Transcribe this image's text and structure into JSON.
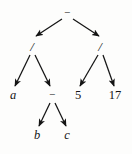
{
  "figure": {
    "kind": "expression-tree",
    "background_color": "#fdfdfc",
    "stroke_color": "#141414",
    "width": 132,
    "height": 154
  },
  "nodes": [
    {
      "id": "root",
      "label": "−",
      "role": "operator",
      "kind": "minus",
      "x": 67,
      "y": 12
    },
    {
      "id": "divL",
      "label": "/",
      "role": "operator",
      "kind": "slash",
      "x": 32,
      "y": 46
    },
    {
      "id": "divR",
      "label": "/",
      "role": "operator",
      "kind": "slash",
      "x": 100,
      "y": 46
    },
    {
      "id": "a",
      "label": "a",
      "role": "variable",
      "kind": "var",
      "x": 13,
      "y": 95
    },
    {
      "id": "minus2",
      "label": "−",
      "role": "operator",
      "kind": "minus",
      "x": 52,
      "y": 94
    },
    {
      "id": "five",
      "label": "5",
      "role": "number",
      "kind": "num",
      "x": 78,
      "y": 95
    },
    {
      "id": "seven",
      "label": "17",
      "role": "number",
      "kind": "num",
      "x": 115,
      "y": 95
    },
    {
      "id": "b",
      "label": "b",
      "role": "variable",
      "kind": "var",
      "x": 37,
      "y": 135
    },
    {
      "id": "c",
      "label": "c",
      "role": "variable",
      "kind": "var",
      "x": 67,
      "y": 135
    }
  ],
  "edges": [
    {
      "from": "root",
      "to": "divL",
      "x1": 62,
      "y1": 19,
      "x2": 36,
      "y2": 36
    },
    {
      "from": "root",
      "to": "divR",
      "x1": 73,
      "y1": 19,
      "x2": 99,
      "y2": 36
    },
    {
      "from": "divL",
      "to": "a",
      "x1": 30,
      "y1": 55,
      "x2": 15,
      "y2": 86
    },
    {
      "from": "divL",
      "to": "minus2",
      "x1": 35,
      "y1": 55,
      "x2": 50,
      "y2": 86
    },
    {
      "from": "divR",
      "to": "five",
      "x1": 98,
      "y1": 55,
      "x2": 80,
      "y2": 86
    },
    {
      "from": "divR",
      "to": "seven",
      "x1": 103,
      "y1": 55,
      "x2": 114,
      "y2": 86
    },
    {
      "from": "minus2",
      "to": "b",
      "x1": 50,
      "y1": 103,
      "x2": 39,
      "y2": 126
    },
    {
      "from": "minus2",
      "to": "c",
      "x1": 55,
      "y1": 103,
      "x2": 66,
      "y2": 126
    }
  ],
  "expression": {
    "infix": "a / (b − c) − 5 / 17"
  }
}
